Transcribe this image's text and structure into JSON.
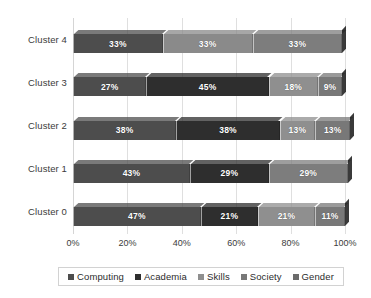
{
  "chart_data": {
    "type": "bar",
    "orientation": "horizontal",
    "stacked": true,
    "stack_mode": "percent",
    "title": "",
    "subtitle": "",
    "xlabel": "",
    "ylabel": "",
    "xlim": [
      0,
      100
    ],
    "xticks": [
      "0%",
      "20%",
      "40%",
      "60%",
      "80%",
      "100%"
    ],
    "xtick_values": [
      0,
      20,
      40,
      60,
      80,
      100
    ],
    "grid": true,
    "grid_axis": "x",
    "legend_position": "bottom",
    "categories": [
      "Cluster 4",
      "Cluster 3",
      "Cluster 2",
      "Cluster 1",
      "Cluster 0"
    ],
    "series": [
      {
        "name": "Computing",
        "color": "#4d4d4d",
        "values": [
          33,
          27,
          38,
          43,
          47
        ]
      },
      {
        "name": "Academia",
        "color": "#2b2b2b",
        "values": [
          0,
          45,
          38,
          29,
          21
        ]
      },
      {
        "name": "Skills",
        "color": "#8f8f8f",
        "values": [
          33,
          18,
          13,
          29,
          21
        ]
      },
      {
        "name": "Society",
        "color": "#7a7a7a",
        "values": [
          33,
          9,
          13,
          0,
          11
        ]
      },
      {
        "name": "Gender",
        "color": "#666666",
        "values": [
          0,
          0,
          0,
          0,
          0
        ]
      }
    ],
    "bars": [
      {
        "category": "Cluster 4",
        "segments": [
          {
            "series": "Computing",
            "value": 33,
            "label": "33%",
            "color": "#4d4d4d"
          },
          {
            "series": "Skills",
            "value": 33,
            "label": "33%",
            "color": "#8a8a8a"
          },
          {
            "series": "Society",
            "value": 33,
            "label": "33%",
            "color": "#7d7d7d"
          }
        ]
      },
      {
        "category": "Cluster 3",
        "segments": [
          {
            "series": "Computing",
            "value": 27,
            "label": "27%",
            "color": "#4d4d4d"
          },
          {
            "series": "Academia",
            "value": 45,
            "label": "45%",
            "color": "#2e2e2e"
          },
          {
            "series": "Skills",
            "value": 18,
            "label": "18%",
            "color": "#8f8f8f"
          },
          {
            "series": "Society",
            "value": 9,
            "label": "9%",
            "color": "#787878"
          }
        ]
      },
      {
        "category": "Cluster 2",
        "segments": [
          {
            "series": "Computing",
            "value": 38,
            "label": "38%",
            "color": "#4d4d4d"
          },
          {
            "series": "Academia",
            "value": 38,
            "label": "38%",
            "color": "#2e2e2e"
          },
          {
            "series": "Skills",
            "value": 13,
            "label": "13%",
            "color": "#8f8f8f"
          },
          {
            "series": "Society",
            "value": 13,
            "label": "13%",
            "color": "#787878"
          }
        ]
      },
      {
        "category": "Cluster 1",
        "segments": [
          {
            "series": "Computing",
            "value": 43,
            "label": "43%",
            "color": "#4d4d4d"
          },
          {
            "series": "Academia",
            "value": 29,
            "label": "29%",
            "color": "#2e2e2e"
          },
          {
            "series": "Skills",
            "value": 29,
            "label": "29%",
            "color": "#7d7d7d"
          }
        ]
      },
      {
        "category": "Cluster 0",
        "segments": [
          {
            "series": "Computing",
            "value": 47,
            "label": "47%",
            "color": "#4d4d4d"
          },
          {
            "series": "Academia",
            "value": 21,
            "label": "21%",
            "color": "#2e2e2e"
          },
          {
            "series": "Skills",
            "value": 21,
            "label": "21%",
            "color": "#8f8f8f"
          },
          {
            "series": "Society",
            "value": 11,
            "label": "11%",
            "color": "#787878"
          }
        ]
      }
    ],
    "legend": [
      {
        "label": "Computing",
        "color": "#4d4d4d"
      },
      {
        "label": "Academia",
        "color": "#2e2e2e"
      },
      {
        "label": "Skills",
        "color": "#8f8f8f"
      },
      {
        "label": "Society",
        "color": "#787878"
      },
      {
        "label": "Gender",
        "color": "#6b6b6b"
      }
    ]
  },
  "colors": {
    "background": "#ffffff",
    "gridline": "#dfdfdf",
    "text": "#3b3b3b",
    "legend_border": "#d2d2d2",
    "bar_cap": "#1f1f1f",
    "label_text": "#ffffff"
  }
}
